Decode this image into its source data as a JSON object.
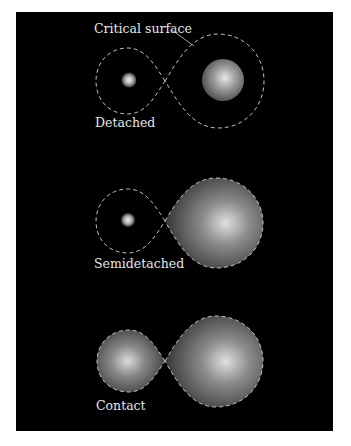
{
  "figure": {
    "background": "#000000",
    "page_background": "#ffffff",
    "lobe_outline_color": "#bfbfbf",
    "annotation": {
      "label": "Critical surface"
    },
    "panels": [
      {
        "label": "Detached",
        "left_star": "small-bright-star",
        "right_star": "large-star-within-lobe"
      },
      {
        "label": "Semidetached",
        "left_star": "small-bright-star",
        "right_star": "star-filling-roche-lobe"
      },
      {
        "label": "Contact",
        "left_star": "star-filling-roche-lobe",
        "right_star": "star-filling-roche-lobe"
      }
    ]
  }
}
